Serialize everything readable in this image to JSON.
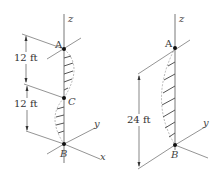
{
  "figure": {
    "left_panel": {
      "points": [
        {
          "label": "A"
        },
        {
          "label": "C"
        },
        {
          "label": "B"
        }
      ],
      "axes": {
        "z": "z",
        "y": "y",
        "x": "x"
      },
      "dimensions": [
        {
          "label": "12 ft"
        },
        {
          "label": "12 ft"
        }
      ]
    },
    "right_panel": {
      "points": [
        {
          "label": "A"
        },
        {
          "label": "B"
        }
      ],
      "axes": {
        "z": "z",
        "y": "y"
      },
      "dimensions": [
        {
          "label": "24 ft"
        }
      ]
    },
    "colors": {
      "line": "#555555",
      "point": "#111111",
      "hatch": "#666666",
      "dashed": "#999999"
    }
  }
}
